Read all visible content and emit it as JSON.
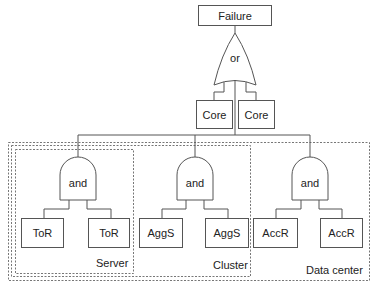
{
  "diagram": {
    "type": "fault-tree",
    "top_event": "Failure",
    "top_gate": "or",
    "or_inputs": [
      "Core",
      "Core"
    ],
    "subtrees": [
      {
        "gate": "and",
        "inputs": [
          "ToR",
          "ToR"
        ],
        "region": "Server"
      },
      {
        "gate": "and",
        "inputs": [
          "AggS",
          "AggS"
        ],
        "region": "Cluster"
      },
      {
        "gate": "and",
        "inputs": [
          "AccR",
          "AccR"
        ],
        "region": "Data center"
      }
    ],
    "colors": {
      "line": "#555555",
      "dashed": "#777777",
      "text": "#222222"
    }
  }
}
